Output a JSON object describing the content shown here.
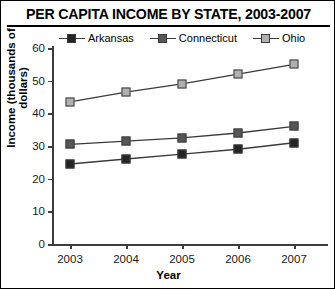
{
  "chart_data": {
    "type": "line",
    "title": "PER CAPITA INCOME BY STATE, 2003-2007",
    "xlabel": "Year",
    "ylabel": "Income (thousands of dollars)",
    "categories": [
      "2003",
      "2004",
      "2005",
      "2006",
      "2007"
    ],
    "xtick_labels": [
      "2003",
      "2004",
      "2005",
      "2006",
      "2007"
    ],
    "ytick_labels": [
      "0",
      "10",
      "20",
      "30",
      "40",
      "50",
      "60"
    ],
    "ytick_values": [
      0,
      10,
      20,
      30,
      40,
      50,
      60
    ],
    "ylim": [
      0,
      60
    ],
    "grid": false,
    "legend_position": "top",
    "series": [
      {
        "name": "Arkansas",
        "color": "#242424",
        "marker": "square",
        "values": [
          24.5,
          26.0,
          27.5,
          29.0,
          31.0
        ]
      },
      {
        "name": "Connecticut",
        "color": "#575757",
        "marker": "square",
        "values": [
          30.5,
          31.5,
          32.5,
          34.0,
          36.0
        ]
      },
      {
        "name": "Ohio",
        "color": "#b0b0b0",
        "marker": "square",
        "values": [
          43.5,
          46.5,
          49.0,
          52.0,
          55.0
        ]
      }
    ]
  },
  "colors": {
    "axis": "#3d3d3d",
    "text": "#000000",
    "background": "#ffffff",
    "border": "#000000"
  }
}
